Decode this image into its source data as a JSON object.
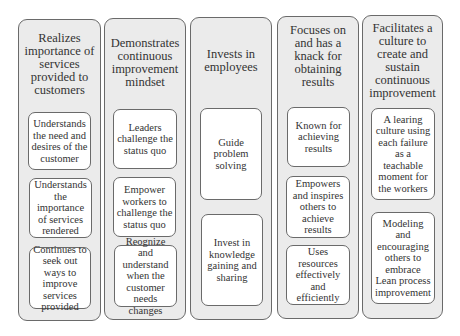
{
  "diagram": {
    "columns": [
      {
        "title": "Realizes importance of services provided to customers",
        "items": [
          "Understands the need and desires of the customer",
          "Understands the importance of services rendered",
          "Continues to seek out ways to improve services provided"
        ]
      },
      {
        "title": "Demonstrates continuous improvement mindset",
        "items": [
          "Leaders challenge the status quo",
          "Empower workers to challenge the status quo",
          "Reognize and understand when the customer needs changes"
        ]
      },
      {
        "title": "Invests in employees",
        "items": [
          "Guide problem solving",
          "Invest in knowledge gaining and sharing"
        ]
      },
      {
        "title": "Focuses on and has a knack for obtaining results",
        "items": [
          "Known for achieving results",
          "Empowers and inspires others to achieve results",
          "Uses resources effectively and efficiently"
        ]
      },
      {
        "title": "Facilitates a culture to create and sustain continuous improvement",
        "items": [
          "A learing culture using each failure as a teachable moment for the workers",
          "Modeling and encouraging others to embrace Lean process improvement"
        ]
      }
    ]
  }
}
